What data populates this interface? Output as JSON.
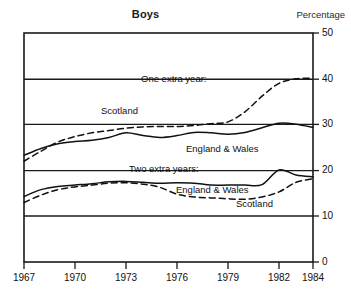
{
  "chart_data": {
    "type": "line",
    "title": "Boys",
    "unit_label": "Percentage",
    "xlabel": "",
    "ylabel": "Percentage",
    "xlim": [
      1967,
      1984
    ],
    "ylim": [
      0,
      50
    ],
    "ytick_values": [
      0,
      10,
      20,
      30,
      40,
      50
    ],
    "ytick_labels": [
      "0",
      "10",
      "20",
      "30",
      "40",
      "50"
    ],
    "xtick_values": [
      1967,
      1970,
      1973,
      1976,
      1979,
      1982,
      1984
    ],
    "xtick_labels": [
      "1967",
      "1970",
      "1973",
      "1976",
      "1979",
      "1982",
      "1984"
    ],
    "grid": "horizontal",
    "legend_position": "inline-annotations",
    "x": [
      1967,
      1968,
      1969,
      1970,
      1971,
      1972,
      1973,
      1974,
      1975,
      1976,
      1977,
      1978,
      1979,
      1980,
      1981,
      1982,
      1983,
      1984
    ],
    "series": [
      {
        "name": "One extra year: England & Wales",
        "style": "solid",
        "group": "One extra year",
        "region": "England & Wales",
        "values": [
          23.3,
          24.8,
          25.8,
          26.3,
          26.6,
          27.2,
          28.2,
          27.6,
          27.2,
          27.6,
          28.3,
          28.2,
          27.9,
          28.3,
          29.3,
          30.3,
          30.1,
          29.4
        ]
      },
      {
        "name": "One extra year: Scotland",
        "style": "dashed",
        "group": "One extra year",
        "region": "Scotland",
        "values": [
          22.0,
          24.2,
          26.2,
          27.4,
          28.2,
          28.7,
          29.2,
          29.5,
          29.6,
          29.6,
          29.8,
          30.2,
          30.6,
          32.8,
          36.2,
          39.0,
          40.0,
          40.1
        ]
      },
      {
        "name": "Two extra years: England & Wales",
        "style": "solid",
        "group": "Two extra years",
        "region": "England & Wales",
        "values": [
          14.3,
          15.8,
          16.5,
          16.8,
          17.1,
          17.5,
          17.6,
          17.4,
          17.2,
          17.3,
          17.2,
          16.8,
          16.8,
          16.8,
          16.9,
          20.1,
          19.0,
          18.6
        ]
      },
      {
        "name": "Two extra years: Scotland",
        "style": "dashed",
        "group": "Two extra years",
        "region": "Scotland",
        "values": [
          13.0,
          14.6,
          15.8,
          16.4,
          16.8,
          17.2,
          17.3,
          17.0,
          16.3,
          14.8,
          14.2,
          14.0,
          13.8,
          13.7,
          14.2,
          15.3,
          17.4,
          18.2
        ]
      }
    ],
    "annotations": [
      {
        "id": "one-extra-year",
        "text": "One extra year:"
      },
      {
        "id": "scotland-upper",
        "text": "Scotland"
      },
      {
        "id": "england-wales-upper",
        "text": "England & Wales"
      },
      {
        "id": "two-extra-years",
        "text": "Two extra years:"
      },
      {
        "id": "england-wales-lower",
        "text": "England & Wales"
      },
      {
        "id": "scotland-lower",
        "text": "Scotland"
      }
    ]
  },
  "colors": {
    "axis": "#1a1a1a",
    "line": "#111111",
    "background": "#ffffff"
  }
}
